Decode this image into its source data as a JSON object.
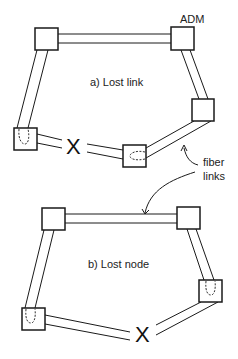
{
  "labels": {
    "adm": "ADM",
    "panel_a": "a) Lost link",
    "panel_b": "b) Lost node",
    "fiber_line1": "fiber",
    "fiber_line2": "links"
  },
  "marks": {
    "failure_a": "X",
    "failure_b": "X"
  },
  "colors": {
    "stroke": "#1a1a1a",
    "background": "#ffffff"
  },
  "panel_a": {
    "nodes": [
      {
        "id": "a-top-left",
        "x": 35,
        "y": 28
      },
      {
        "id": "a-top-right",
        "x": 171,
        "y": 27
      },
      {
        "id": "a-right",
        "x": 192,
        "y": 99
      },
      {
        "id": "a-bottom-mid",
        "x": 123,
        "y": 145
      },
      {
        "id": "a-bottom-left",
        "x": 14,
        "y": 128
      }
    ],
    "failed_link": "a-bottom-left to a-bottom-mid"
  },
  "panel_b": {
    "nodes": [
      {
        "id": "b-top-left",
        "x": 42,
        "y": 208
      },
      {
        "id": "b-top-right",
        "x": 177,
        "y": 207
      },
      {
        "id": "b-right",
        "x": 199,
        "y": 280
      },
      {
        "id": "b-bottom-left",
        "x": 22,
        "y": 308
      }
    ],
    "failed_node": "bottom-middle"
  }
}
